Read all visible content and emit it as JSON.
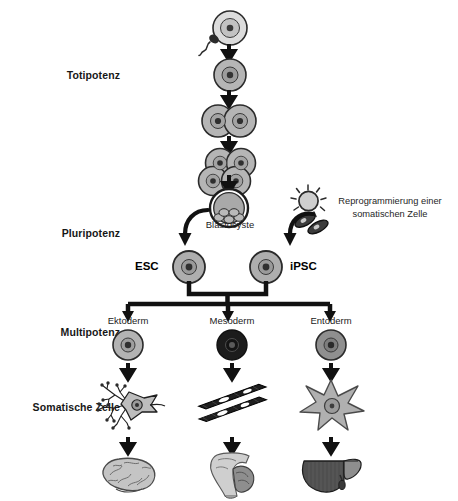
{
  "figure": {
    "language": "de"
  },
  "stage_labels": [
    {
      "id": "totipotenz",
      "label": "Totipotenz"
    },
    {
      "id": "pluripotenz",
      "label": "Pluripotenz"
    },
    {
      "id": "multipotenz",
      "label": "Multipotenz"
    },
    {
      "id": "somatische-zelle",
      "label": "Somatische Zelle"
    }
  ],
  "development_chain": [
    {
      "id": "zygote",
      "label": "",
      "stage": "Befruchtete Eizelle"
    },
    {
      "id": "one-cell",
      "label": "",
      "stage": "Einzellstadium"
    },
    {
      "id": "two-cell",
      "label": "",
      "stage": "Zweizellstadium"
    },
    {
      "id": "four-cell",
      "label": "",
      "stage": "Vierzellstadium"
    },
    {
      "id": "blastocyst",
      "label": "Blastocyste",
      "stage": "Blastocyste"
    }
  ],
  "reprogramming": {
    "caption_line1": "Reprogrammierung einer",
    "caption_line2": "somatischen Zelle",
    "icon": "virus-vector-icon",
    "cell_icon": "fibroblast-icon"
  },
  "pluripotent_cells": [
    {
      "id": "esc",
      "label": "ESC",
      "label_side": "left"
    },
    {
      "id": "ipsc",
      "label": "iPSC",
      "label_side": "right"
    }
  ],
  "germ_layers": [
    {
      "id": "ektoderm",
      "label": "Ektoderm",
      "color": "#b3b3b3",
      "somatic_cell": "neuron-icon",
      "somatic_cell_name": "Neuron",
      "organ": "brain-icon",
      "organ_name": "Gehirn"
    },
    {
      "id": "mesoderm",
      "label": "Mesoderm",
      "color": "#1c1c1c",
      "somatic_cell": "muscle-fiber-icon",
      "somatic_cell_name": "Muskelzelle",
      "organ": "muscle-arm-icon",
      "organ_name": "Muskel"
    },
    {
      "id": "entoderm",
      "label": "Entoderm",
      "color": "#8f8f8f",
      "somatic_cell": "hepatocyte-icon",
      "somatic_cell_name": "Leberzelle",
      "organ": "liver-icon",
      "organ_name": "Leber"
    }
  ],
  "colors": {
    "arrow": "#111111",
    "cell_fill_light": "#d9d9d9",
    "cell_fill_mid": "#a8a8a8",
    "cell_fill_dark": "#1c1c1c",
    "cell_stroke": "#2b2b2b",
    "nucleus": "#3a3a3a",
    "text": "#1a1a1a"
  }
}
